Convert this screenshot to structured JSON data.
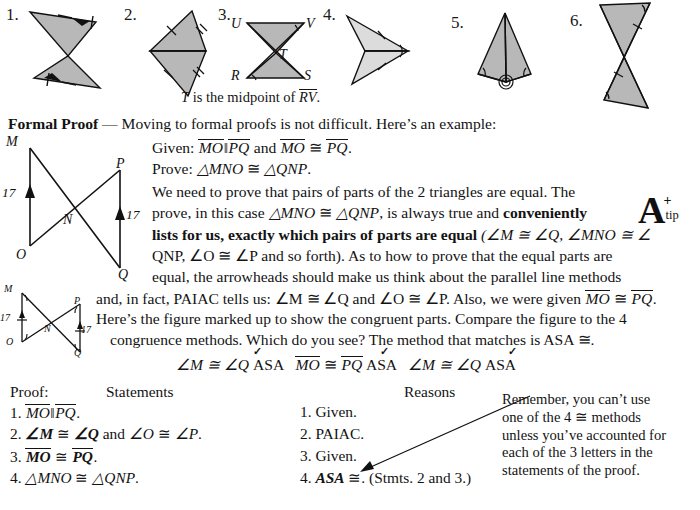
{
  "problems": [
    {
      "number": "1.",
      "figure": "bowtie-two-shaded-triangles-arrowheads-ticks"
    },
    {
      "number": "2.",
      "figure": "kite-two-shaded-triangles-tick-marks"
    },
    {
      "number": "3.",
      "figure": "hourglass-UVTRS-shaded",
      "labels": [
        "U",
        "V",
        "T",
        "R",
        "S"
      ],
      "caption_pre": "T",
      "caption_mid": " is the midpoint of ",
      "caption_seg": "RV",
      "caption_end": "."
    },
    {
      "number": "4.",
      "figure": "dart-arrowhead-two-triangles-single-ticks"
    },
    {
      "number": "5.",
      "figure": "kite-with-vertical-altitude-right-angles"
    },
    {
      "number": "6.",
      "figure": "tall-bowtie-two-shaded-triangles"
    }
  ],
  "formal_proof": {
    "heading": "Formal Proof",
    "heading_dash": " — ",
    "intro": "Moving to formal proofs is not difficult. Here’s an example:",
    "given_label": "Given:",
    "given_text_1": "MO",
    "given_parallel": "‖",
    "given_text_2": "PQ",
    "given_and": " and ",
    "given_text_3": "MO",
    "given_cong": " ≅ ",
    "given_text_4": "PQ",
    "given_period": ".",
    "prove_label": "Prove:",
    "prove_tri1": "△MNO",
    "prove_cong": " ≅ ",
    "prove_tri2": "△QNP",
    "prove_period": ".",
    "para_line_1": "We need to prove that pairs of parts of the 2 triangles are equal. The",
    "para_line_2_a": "prove, in this case ",
    "para_line_2_tri1": "△MNO",
    "para_line_2_cong": " ≅ ",
    "para_line_2_tri2": "△QNP",
    "para_line_2_b": ", is always true and ",
    "para_line_2_bold": "conveniently",
    "para_line_3_bold": "lists for us, exactly which pairs of parts are equal",
    "para_line_3_rest": "  (∠M ≅ ∠Q,  ∠MNO ≅ ∠",
    "para_line_4": "QNP,  ∠O ≅ ∠P and so forth). As to how to prove that the equal parts are",
    "para_line_5": "equal, the arrowheads should make us think about the parallel line methods",
    "para_line_6": "and, in fact, PAIAC tells us:  ∠M ≅ ∠Q and ∠O ≅ ∠P. Also, we were given ",
    "para_line_6_seg1": "MO",
    "para_line_6_cong": " ≅ ",
    "para_line_6_seg2": "PQ",
    "para_line_6_end": ".",
    "para_line_7": "Here’s the figure marked up to show the congruent parts. Compare the figure to the 4",
    "para_line_8": "congruence methods. Which do you see?  The method that matches is ASA ≅."
  },
  "tip_icon": {
    "letter": "A",
    "superscript": "+",
    "sublabel": "tip"
  },
  "asa_row": {
    "item1_pre": "∠M ≅ ∠Q ",
    "item1_a": "A",
    "item1_rest": "SA",
    "item2_seg1": "MO",
    "item2_cong": " ≅ ",
    "item2_seg2": "PQ",
    "item2_a": "A",
    "item2_s": "S",
    "item2_a2": "A",
    "item3_pre": "∠M ≅ ∠Q ",
    "item3_as": "AS",
    "item3_a": "A"
  },
  "proof_table": {
    "proof_label": "Proof:",
    "statements_header": "Statements",
    "reasons_header": "Reasons",
    "statements": [
      {
        "num": "1.",
        "text_seg1": "MO",
        "sep": "‖",
        "text_seg2": "PQ",
        "tail": "."
      },
      {
        "num": "2.",
        "bold1": "∠M",
        "cong1": " ≅ ",
        "bold2": "∠Q",
        "mid": " and ",
        "plain1": "∠O",
        "cong2": " ≅ ",
        "plain2": "∠P",
        "tail": "."
      },
      {
        "num": "3.",
        "bseg1": "MO",
        "cong": " ≅ ",
        "bseg2": "PQ",
        "tail": "."
      },
      {
        "num": "4.",
        "tri1": "△MNO",
        "cong": " ≅ ",
        "tri2": "△QNP",
        "tail": "."
      }
    ],
    "reasons": [
      {
        "num": "1.",
        "text": "Given."
      },
      {
        "num": "2.",
        "text": "PAIAC."
      },
      {
        "num": "3.",
        "text": "Given."
      },
      {
        "num": "4.",
        "bold": "ASA",
        "cong": " ≅",
        "text": ". (Stmts. 2 and 3.)"
      }
    ]
  },
  "remember_note": {
    "line1": "Remember, you can’t use",
    "line2": "one of the 4 ≅ methods",
    "line3": "unless you’ve accounted for",
    "line4": "each of the 3 letters in the",
    "line5": "statements of the proof."
  },
  "main_figure": {
    "labels": {
      "M": "M",
      "P": "P",
      "N": "N",
      "O": "O",
      "Q": "Q"
    },
    "len_left": "17",
    "len_right": "17"
  },
  "marked_figure": {
    "labels": {
      "M": "M",
      "P": "P",
      "N": "N",
      "O": "O",
      "Q": "Q"
    },
    "len_left": "17",
    "len_right": "17"
  },
  "colors": {
    "ink": "#131313",
    "shade": "#b8b8b8",
    "shade_light": "#dcdcdc",
    "page": "#ffffff"
  }
}
